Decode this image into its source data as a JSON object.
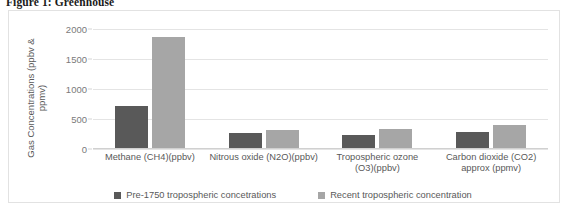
{
  "figure": {
    "caption": "Figure 1: Greenhouse"
  },
  "chart_data": {
    "type": "bar",
    "title": "",
    "xlabel": "",
    "ylabel": "Gas Concentrations (ppbv & ppmv)",
    "ylabel_line1": "Gas Concentrations (ppbv &",
    "ylabel_line2": "ppmv)",
    "ylim": [
      0,
      2000
    ],
    "yticks": [
      0,
      500,
      1000,
      1500,
      2000
    ],
    "ytick_labels": [
      "0",
      "500",
      "1000",
      "1500",
      "2000"
    ],
    "grid": true,
    "legend_position": "bottom",
    "categories": [
      "Methane (CH4)(ppbv)",
      "Nitrous oxide (N2O)(ppbv)",
      "Tropospheric ozone (O3)(ppbv)",
      "Carbon dioxide (CO2) approx (ppmv)"
    ],
    "categories_lines": [
      [
        "Methane (CH4)(ppbv)"
      ],
      [
        "Nitrous oxide (N2O)(ppbv)"
      ],
      [
        "Tropospheric ozone",
        "(O3)(ppbv)"
      ],
      [
        "Carbon dioxide (CO2)",
        "approx (ppmv)"
      ]
    ],
    "series": [
      {
        "name": "Pre-1750 tropospheric concetrations",
        "color": "#595959",
        "values": [
          722,
          270,
          237,
          280
        ]
      },
      {
        "name": "Recent tropospheric concentration",
        "color": "#a6a6a6",
        "values": [
          1870,
          322,
          337,
          400
        ]
      }
    ]
  }
}
